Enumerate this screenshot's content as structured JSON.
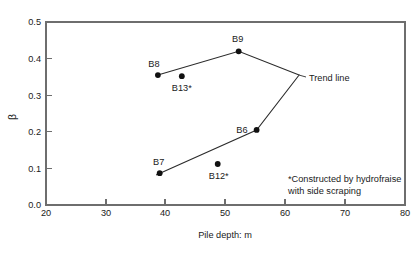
{
  "chart_data": {
    "type": "scatter",
    "title": "",
    "xlabel": "Pile depth: m",
    "ylabel": "β",
    "xlim": [
      20,
      80
    ],
    "ylim": [
      0.0,
      0.5
    ],
    "xticks": [
      "20",
      "30",
      "40",
      "50",
      "60",
      "70",
      "80"
    ],
    "xtick_values": [
      20,
      30,
      40,
      50,
      60,
      70,
      80
    ],
    "yticks": [
      "0.0",
      "0.1",
      "0.2",
      "0.3",
      "0.4",
      "0.5"
    ],
    "ytick_values": [
      0.0,
      0.1,
      0.2,
      0.3,
      0.4,
      0.5
    ],
    "grid": false,
    "legend": false,
    "points": [
      {
        "label": "B8",
        "x": 38.7,
        "y": 0.355,
        "label_dx": -4,
        "label_dy": -8,
        "label_anchor": "middle"
      },
      {
        "label": "B13*",
        "x": 42.7,
        "y": 0.352,
        "label_dx": 0,
        "label_dy": 15,
        "label_anchor": "middle"
      },
      {
        "label": "B9",
        "x": 52.2,
        "y": 0.42,
        "label_dx": -1,
        "label_dy": -9,
        "label_anchor": "middle"
      },
      {
        "label": "B6",
        "x": 55.2,
        "y": 0.205,
        "label_dx": -9,
        "label_dy": 3,
        "label_anchor": "end"
      },
      {
        "label": "B12*",
        "x": 48.7,
        "y": 0.112,
        "label_dx": 1,
        "label_dy": 15,
        "label_anchor": "middle"
      },
      {
        "label": "B7",
        "x": 39.0,
        "y": 0.087,
        "label_dx": -1,
        "label_dy": -8,
        "label_anchor": "middle"
      }
    ],
    "trend_line": {
      "name": "Trend line",
      "vertices": [
        {
          "x": 38.7,
          "y": 0.355
        },
        {
          "x": 52.2,
          "y": 0.42
        },
        {
          "x": 62.3,
          "y": 0.355
        },
        {
          "x": 55.2,
          "y": 0.205
        },
        {
          "x": 38.4,
          "y": 0.082
        }
      ]
    },
    "annotations": [
      {
        "name": "trend-line-label",
        "text": "Trend line",
        "x": 63.8,
        "y": 0.355
      }
    ],
    "footnote": {
      "line1": "*Constructed by hydrofraise",
      "line2": "with side scraping"
    }
  }
}
